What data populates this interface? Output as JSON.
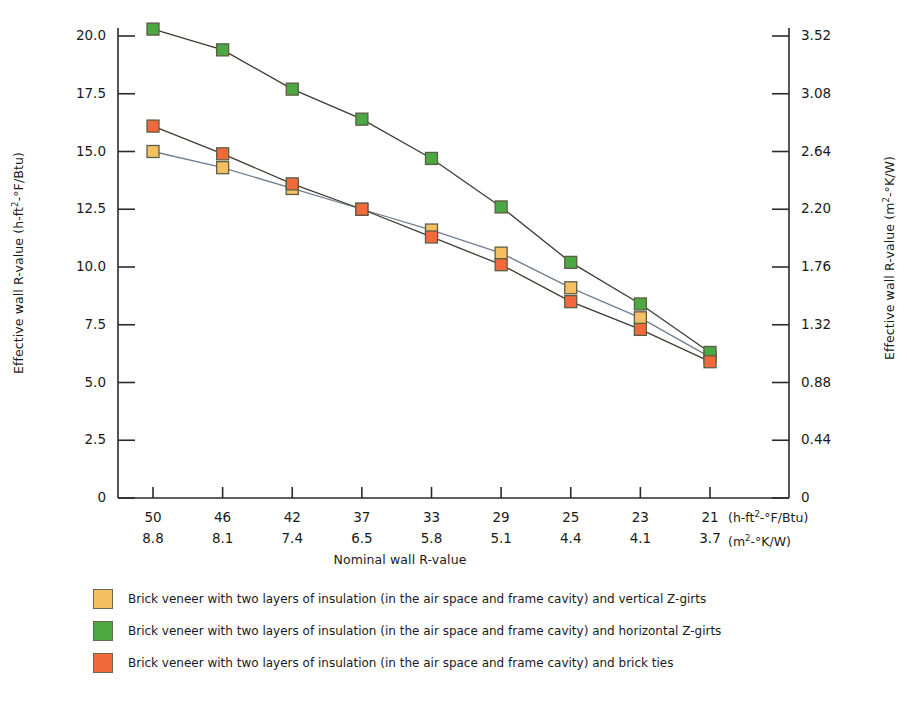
{
  "chart_data": {
    "type": "line",
    "title": "",
    "categories": [
      "50",
      "46",
      "42",
      "37",
      "33",
      "29",
      "25",
      "23",
      "21"
    ],
    "categories_si": [
      "8.8",
      "8.1",
      "7.4",
      "6.5",
      "5.8",
      "5.1",
      "4.4",
      "4.1",
      "3.7"
    ],
    "xlabel": "Nominal wall R-value",
    "x_unit_ip": "(h-ft²-°F/Btu)",
    "x_unit_si": "(m²-°K/W)",
    "ylabel": "Effective wall R-value (h-ft²-°F/Btu)",
    "ylabel_right": "Effective wall R-value (m²-°K/W)",
    "ylim": [
      0,
      20.0
    ],
    "yticks": [
      "0",
      "2.5",
      "5.0",
      "7.5",
      "10.0",
      "12.5",
      "15.0",
      "17.5",
      "20.0"
    ],
    "ytick_values": [
      0,
      2.5,
      5.0,
      7.5,
      10.0,
      12.5,
      15.0,
      17.5,
      20.0
    ],
    "yticks_right": [
      "0",
      "0.44",
      "0.88",
      "1.32",
      "1.76",
      "2.20",
      "2.64",
      "3.08",
      "3.52"
    ],
    "grid": false,
    "legend_position": "below",
    "series": [
      {
        "name": "Brick veneer with two layers of insulation (in the air space and frame cavity) and vertical Z-girts",
        "color": "#f5c062",
        "values": [
          15.0,
          14.3,
          13.4,
          12.5,
          11.6,
          10.6,
          9.1,
          7.8,
          6.1
        ]
      },
      {
        "name": "Brick veneer with two layers of insulation (in the air space and frame cavity) and horizontal Z-girts",
        "color": "#4ca843",
        "values": [
          20.3,
          19.4,
          17.7,
          16.4,
          14.7,
          12.6,
          10.2,
          8.4,
          6.3
        ]
      },
      {
        "name": "Brick veneer with two layers of insulation (in the air space and frame cavity) and brick ties",
        "color": "#f26a3c",
        "values": [
          16.1,
          14.9,
          13.6,
          12.5,
          11.3,
          10.1,
          8.5,
          7.3,
          5.9
        ]
      }
    ]
  },
  "legend": {
    "items": [
      {
        "swatch_color": "#f5c062",
        "label": "Brick veneer with two layers of insulation (in the air space and frame cavity) and vertical Z-girts"
      },
      {
        "swatch_color": "#4ca843",
        "label": "Brick veneer with two layers of insulation (in the air space and frame cavity) and horizontal Z-girts"
      },
      {
        "swatch_color": "#f26a3c",
        "label": "Brick veneer with two layers of insulation (in the air space and frame cavity) and brick ties"
      }
    ]
  }
}
